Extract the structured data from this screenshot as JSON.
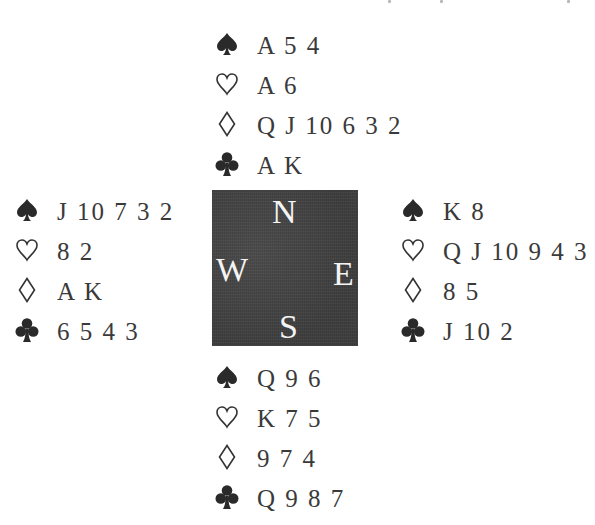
{
  "diagram": {
    "type": "bridge-deal",
    "compass": {
      "north": "N",
      "south": "S",
      "east": "E",
      "west": "W",
      "background_color": "#454545",
      "letter_color": "#f4f4f4"
    },
    "suit_icons": {
      "spades": "spade-icon (filled)",
      "hearts": "heart-icon (outline)",
      "diamonds": "diamond-icon (outline)",
      "clubs": "club-icon (filled)"
    },
    "hands": {
      "north": {
        "spades": "A 5 4",
        "hearts": "A 6",
        "diamonds": "Q J 10 6 3 2",
        "clubs": "A K"
      },
      "west": {
        "spades": "J 10 7 3 2",
        "hearts": "8 2",
        "diamonds": "A K",
        "clubs": "6 5 4 3"
      },
      "east": {
        "spades": "K 8",
        "hearts": "Q J 10 9 4 3",
        "diamonds": "8 5",
        "clubs": "J 10 2"
      },
      "south": {
        "spades": "Q 9 6",
        "hearts": "K 7 5",
        "diamonds": "9 7 4",
        "clubs": "Q 9 8 7"
      }
    }
  }
}
